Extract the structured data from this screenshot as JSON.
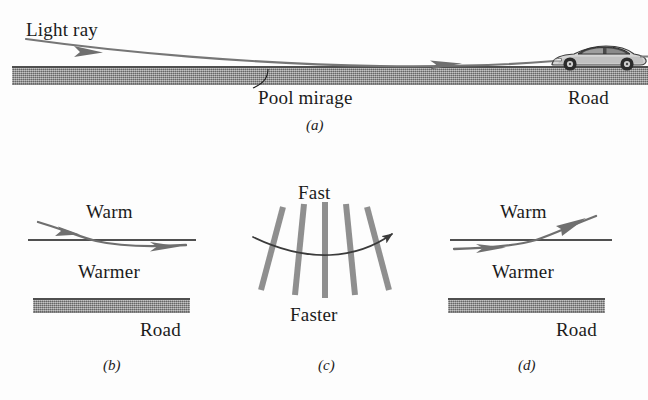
{
  "figure": {
    "background_color": "#fdfdfd",
    "ink_color": "#1b1b1b",
    "ray_color": "#6f6f6f",
    "road_color": "#8d8d8d",
    "wavefront_color": "#8a8a8a"
  },
  "panel_a": {
    "caption": "(a)",
    "light_ray_label": "Light ray",
    "pool_mirage_label": "Pool mirage",
    "road_label": "Road",
    "car_icon": "sports-car-icon"
  },
  "panel_b": {
    "caption": "(b)",
    "warm_label": "Warm",
    "warmer_label": "Warmer",
    "road_label": "Road"
  },
  "panel_c": {
    "caption": "(c)",
    "fast_label": "Fast",
    "faster_label": "Faster",
    "wavefront_count": 5
  },
  "panel_d": {
    "caption": "(d)",
    "warm_label": "Warm",
    "warmer_label": "Warmer",
    "road_label": "Road"
  }
}
